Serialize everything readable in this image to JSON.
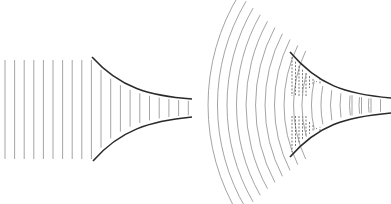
{
  "diagram": {
    "panels": [
      {
        "id": "plane-wave-horn",
        "wave_type": "plane",
        "free_wavefront_count": 10,
        "in_horn_wavefront_count": 10
      },
      {
        "id": "spherical-wave-horn",
        "wave_type": "spherical",
        "free_wavefront_count": 10,
        "in_horn_wavefront_count": 8,
        "has_hatched_region": true
      }
    ],
    "colors": {
      "wavefront": "#9a9a9a",
      "horn_wall": "#2a2a2a",
      "hatch": "#555555",
      "background": "#ffffff"
    }
  }
}
